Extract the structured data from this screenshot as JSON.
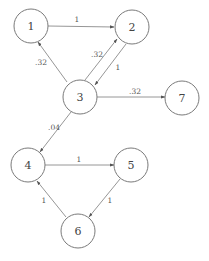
{
  "diagram": {
    "type": "directed-weighted-graph",
    "nodes": [
      {
        "id": "1",
        "label": "1",
        "x": 31,
        "y": 26
      },
      {
        "id": "2",
        "label": "2",
        "x": 132,
        "y": 27
      },
      {
        "id": "3",
        "label": "3",
        "x": 80,
        "y": 97
      },
      {
        "id": "7",
        "label": "7",
        "x": 182,
        "y": 98
      },
      {
        "id": "4",
        "label": "4",
        "x": 28,
        "y": 165
      },
      {
        "id": "5",
        "label": "5",
        "x": 131,
        "y": 165
      },
      {
        "id": "6",
        "label": "6",
        "x": 78,
        "y": 231
      }
    ],
    "node_radius": 17,
    "edges": [
      {
        "from": "1",
        "to": "2",
        "label": "1"
      },
      {
        "from": "3",
        "to": "1",
        "label": ".32"
      },
      {
        "from": "3",
        "to": "2",
        "label": ".32"
      },
      {
        "from": "2",
        "to": "3",
        "label": "1"
      },
      {
        "from": "3",
        "to": "7",
        "label": ".32"
      },
      {
        "from": "3",
        "to": "4",
        "label": ".04"
      },
      {
        "from": "4",
        "to": "5",
        "label": "1"
      },
      {
        "from": "5",
        "to": "6",
        "label": "1"
      },
      {
        "from": "6",
        "to": "4",
        "label": "1"
      }
    ]
  }
}
